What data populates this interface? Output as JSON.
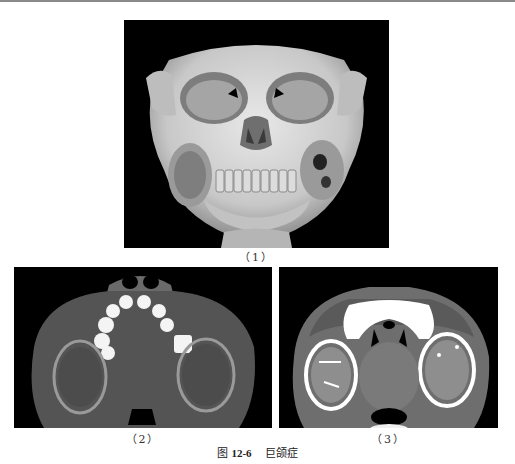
{
  "figure": {
    "label_prefix": "图",
    "number": "12-6",
    "title": "巨颌症"
  },
  "panels": [
    {
      "id": "1",
      "caption": "（1）",
      "description": "3D CT volume rendering of skull, frontal view, showing bilateral expansile multilocular lesions of the mandible"
    },
    {
      "id": "2",
      "caption": "（2）",
      "description": "Axial CT bone window showing bilateral expansile mandibular lesions"
    },
    {
      "id": "3",
      "caption": "（3）",
      "description": "Axial CT soft-tissue window showing bilateral multilocular expansile mandibular lesions"
    }
  ],
  "colors": {
    "background": "#ffffff",
    "panel_bg": "#000000",
    "rule": "#8a8a8a"
  }
}
